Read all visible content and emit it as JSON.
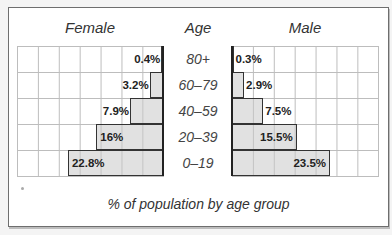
{
  "chart_data": {
    "type": "bar",
    "subtype": "population-pyramid",
    "title": "",
    "caption": "% of population by age group",
    "left_label": "Female",
    "center_label": "Age",
    "right_label": "Male",
    "categories": [
      "80+",
      "60–79",
      "40–59",
      "20–39",
      "0–19"
    ],
    "series": [
      {
        "name": "Female",
        "values": [
          0.4,
          3.2,
          7.9,
          16,
          22.8
        ],
        "labels": [
          "0.4%",
          "3.2%",
          "7.9%",
          "16%",
          "22.8%"
        ]
      },
      {
        "name": "Male",
        "values": [
          0.3,
          2.9,
          7.5,
          15.5,
          23.5
        ],
        "labels": [
          "0.3%",
          "2.9%",
          "7.5%",
          "15.5%",
          "23.5%"
        ]
      }
    ],
    "xlim": [
      0,
      35
    ],
    "grid_step": 5,
    "grid": true,
    "bar_fill": "#dcdcdc",
    "bar_border": "#333333"
  }
}
